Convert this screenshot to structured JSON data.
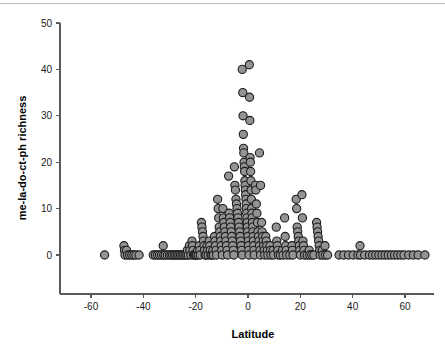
{
  "chart_data": {
    "type": "scatter",
    "title": "",
    "xlabel": "Latitude",
    "ylabel": "me-la-do-ct-ph richness",
    "xlim": [
      -70,
      75
    ],
    "ylim": [
      -4,
      50
    ],
    "xticks": [
      -60,
      -40,
      -20,
      0,
      20,
      40,
      60
    ],
    "xtick_labels": [
      "-60",
      "-40",
      "-20",
      "0",
      "20",
      "40",
      "60"
    ],
    "yticks": [
      0,
      10,
      20,
      30,
      40,
      50
    ],
    "ytick_labels": [
      "0",
      "10",
      "20",
      "30",
      "40",
      "50"
    ],
    "grid": false,
    "legend": null,
    "marker": {
      "shape": "circle",
      "fill_color": "#939393",
      "edge_color": "#1c1c1c",
      "radius_px": 4.1
    },
    "series": [
      {
        "name": "sites",
        "points": [
          [
            -54.8,
            0
          ],
          [
            -47.4,
            2
          ],
          [
            -47.2,
            1
          ],
          [
            -47.0,
            0
          ],
          [
            -46.4,
            1
          ],
          [
            -46.0,
            0
          ],
          [
            -45.2,
            0
          ],
          [
            -44.4,
            0
          ],
          [
            -43.6,
            0
          ],
          [
            -42.8,
            0
          ],
          [
            -41.6,
            0
          ],
          [
            -36.2,
            0
          ],
          [
            -35.4,
            0
          ],
          [
            -34.6,
            0
          ],
          [
            -33.8,
            0
          ],
          [
            -33.0,
            0
          ],
          [
            -32.4,
            2
          ],
          [
            -32.2,
            0
          ],
          [
            -31.6,
            0
          ],
          [
            -30.8,
            0
          ],
          [
            -30.0,
            0
          ],
          [
            -29.4,
            0
          ],
          [
            -28.8,
            0
          ],
          [
            -28.2,
            0
          ],
          [
            -27.6,
            0
          ],
          [
            -27.0,
            0
          ],
          [
            -26.4,
            0
          ],
          [
            -25.8,
            0
          ],
          [
            -25.2,
            0
          ],
          [
            -24.6,
            0
          ],
          [
            -24.0,
            0
          ],
          [
            -23.4,
            0
          ],
          [
            -23.2,
            1
          ],
          [
            -22.8,
            0
          ],
          [
            -22.4,
            2
          ],
          [
            -22.2,
            1
          ],
          [
            -21.8,
            0
          ],
          [
            -21.4,
            3
          ],
          [
            -21.2,
            2
          ],
          [
            -21.0,
            1
          ],
          [
            -20.8,
            0
          ],
          [
            -20.4,
            0
          ],
          [
            -20.0,
            0
          ],
          [
            -19.6,
            0
          ],
          [
            -19.2,
            1
          ],
          [
            -19.0,
            0
          ],
          [
            -18.6,
            2
          ],
          [
            -18.4,
            1
          ],
          [
            -18.2,
            0
          ],
          [
            -17.8,
            7
          ],
          [
            -17.6,
            6
          ],
          [
            -17.4,
            5
          ],
          [
            -17.2,
            4
          ],
          [
            -17.0,
            3
          ],
          [
            -16.8,
            2
          ],
          [
            -16.6,
            1
          ],
          [
            -16.4,
            0
          ],
          [
            -16.0,
            0
          ],
          [
            -15.6,
            2
          ],
          [
            -15.4,
            1
          ],
          [
            -15.2,
            0
          ],
          [
            -14.8,
            3
          ],
          [
            -14.6,
            2
          ],
          [
            -14.4,
            1
          ],
          [
            -14.2,
            0
          ],
          [
            -13.8,
            0
          ],
          [
            -13.4,
            1
          ],
          [
            -13.2,
            0
          ],
          [
            -12.8,
            4
          ],
          [
            -12.6,
            3
          ],
          [
            -12.4,
            2
          ],
          [
            -12.2,
            1
          ],
          [
            -12.0,
            0
          ],
          [
            -11.6,
            12
          ],
          [
            -11.4,
            10
          ],
          [
            -11.2,
            8
          ],
          [
            -11.0,
            6
          ],
          [
            -10.8,
            5
          ],
          [
            -10.6,
            4
          ],
          [
            -10.4,
            3
          ],
          [
            -10.2,
            2
          ],
          [
            -10.0,
            1
          ],
          [
            -9.8,
            0
          ],
          [
            -9.6,
            10
          ],
          [
            -9.4,
            8
          ],
          [
            -9.2,
            7
          ],
          [
            -9.0,
            6
          ],
          [
            -8.8,
            5
          ],
          [
            -8.6,
            4
          ],
          [
            -8.4,
            3
          ],
          [
            -8.2,
            2
          ],
          [
            -8.0,
            1
          ],
          [
            -7.8,
            0
          ],
          [
            -7.4,
            17
          ],
          [
            -7.2,
            9
          ],
          [
            -7.0,
            8
          ],
          [
            -6.8,
            7
          ],
          [
            -6.6,
            6
          ],
          [
            -6.4,
            5
          ],
          [
            -6.2,
            4
          ],
          [
            -6.0,
            3
          ],
          [
            -5.8,
            2
          ],
          [
            -5.6,
            1
          ],
          [
            -5.4,
            0
          ],
          [
            -5.2,
            19
          ],
          [
            -5.0,
            15
          ],
          [
            -4.8,
            14
          ],
          [
            -4.6,
            12
          ],
          [
            -4.4,
            11
          ],
          [
            -4.2,
            10
          ],
          [
            -4.0,
            9
          ],
          [
            -3.8,
            8
          ],
          [
            -3.6,
            7
          ],
          [
            -3.4,
            6
          ],
          [
            -3.2,
            5
          ],
          [
            -3.0,
            4
          ],
          [
            -2.8,
            3
          ],
          [
            -2.6,
            2
          ],
          [
            -2.4,
            1
          ],
          [
            -2.2,
            0
          ],
          [
            -2.2,
            40
          ],
          [
            -2.0,
            35
          ],
          [
            -1.9,
            30
          ],
          [
            -1.8,
            26
          ],
          [
            -1.7,
            23
          ],
          [
            -1.6,
            22
          ],
          [
            -1.5,
            20
          ],
          [
            -1.4,
            19
          ],
          [
            -1.3,
            18
          ],
          [
            -1.2,
            16
          ],
          [
            -1.1,
            15
          ],
          [
            -1.0,
            14
          ],
          [
            -0.9,
            13
          ],
          [
            -0.8,
            12
          ],
          [
            -0.7,
            11
          ],
          [
            -0.6,
            10
          ],
          [
            -0.5,
            9
          ],
          [
            -0.4,
            8
          ],
          [
            -0.3,
            7
          ],
          [
            -0.2,
            6
          ],
          [
            -0.1,
            5
          ],
          [
            0.0,
            4
          ],
          [
            0.1,
            3
          ],
          [
            0.2,
            2
          ],
          [
            0.3,
            1
          ],
          [
            0.4,
            0
          ],
          [
            0.5,
            41
          ],
          [
            0.6,
            34
          ],
          [
            0.7,
            29
          ],
          [
            0.8,
            21
          ],
          [
            0.9,
            20
          ],
          [
            1.0,
            18
          ],
          [
            1.1,
            16
          ],
          [
            1.2,
            14
          ],
          [
            1.3,
            12
          ],
          [
            1.4,
            10
          ],
          [
            1.5,
            9
          ],
          [
            1.6,
            8
          ],
          [
            1.7,
            7
          ],
          [
            1.8,
            6
          ],
          [
            1.9,
            5
          ],
          [
            2.0,
            4
          ],
          [
            2.1,
            3
          ],
          [
            2.2,
            2
          ],
          [
            2.3,
            1
          ],
          [
            2.4,
            0
          ],
          [
            2.8,
            15
          ],
          [
            3.0,
            14
          ],
          [
            3.2,
            11
          ],
          [
            3.4,
            9
          ],
          [
            3.6,
            7
          ],
          [
            3.8,
            5
          ],
          [
            4.0,
            4
          ],
          [
            4.2,
            3
          ],
          [
            4.4,
            2
          ],
          [
            4.6,
            1
          ],
          [
            4.8,
            0
          ],
          [
            4.4,
            22
          ],
          [
            4.8,
            15
          ],
          [
            5.2,
            7
          ],
          [
            5.4,
            5
          ],
          [
            5.6,
            4
          ],
          [
            5.8,
            3
          ],
          [
            6.0,
            2
          ],
          [
            6.2,
            1
          ],
          [
            6.4,
            0
          ],
          [
            6.8,
            4
          ],
          [
            7.0,
            3
          ],
          [
            7.2,
            2
          ],
          [
            7.4,
            1
          ],
          [
            7.6,
            0
          ],
          [
            8.4,
            2
          ],
          [
            8.6,
            1
          ],
          [
            8.8,
            0
          ],
          [
            9.6,
            1
          ],
          [
            9.8,
            0
          ],
          [
            10.8,
            6
          ],
          [
            11.0,
            3
          ],
          [
            11.2,
            2
          ],
          [
            11.4,
            1
          ],
          [
            11.6,
            0
          ],
          [
            12.4,
            0
          ],
          [
            13.2,
            1
          ],
          [
            13.4,
            0
          ],
          [
            14.0,
            8
          ],
          [
            14.2,
            4
          ],
          [
            14.4,
            2
          ],
          [
            14.6,
            1
          ],
          [
            14.8,
            0
          ],
          [
            16.0,
            0
          ],
          [
            16.8,
            2
          ],
          [
            17.0,
            1
          ],
          [
            17.2,
            0
          ],
          [
            18.4,
            12
          ],
          [
            18.6,
            10
          ],
          [
            18.8,
            6
          ],
          [
            19.0,
            5
          ],
          [
            19.2,
            4
          ],
          [
            19.4,
            3
          ],
          [
            19.6,
            2
          ],
          [
            19.8,
            1
          ],
          [
            20.0,
            0
          ],
          [
            20.6,
            13
          ],
          [
            20.8,
            8
          ],
          [
            21.0,
            3
          ],
          [
            21.2,
            2
          ],
          [
            21.4,
            1
          ],
          [
            21.6,
            0
          ],
          [
            22.6,
            0
          ],
          [
            23.4,
            1
          ],
          [
            23.6,
            0
          ],
          [
            24.4,
            0
          ],
          [
            25.2,
            0
          ],
          [
            26.2,
            7
          ],
          [
            26.4,
            6
          ],
          [
            26.6,
            5
          ],
          [
            26.8,
            4
          ],
          [
            27.0,
            3
          ],
          [
            27.2,
            2
          ],
          [
            27.4,
            1
          ],
          [
            27.6,
            0
          ],
          [
            28.4,
            1
          ],
          [
            28.6,
            0
          ],
          [
            29.4,
            2
          ],
          [
            29.6,
            0
          ],
          [
            30.4,
            0
          ],
          [
            34.8,
            0
          ],
          [
            36.6,
            0
          ],
          [
            38.4,
            0
          ],
          [
            40.2,
            0
          ],
          [
            42.0,
            0
          ],
          [
            42.8,
            2
          ],
          [
            43.0,
            0
          ],
          [
            44.6,
            0
          ],
          [
            46.4,
            0
          ],
          [
            47.6,
            0
          ],
          [
            48.8,
            0
          ],
          [
            50.0,
            0
          ],
          [
            51.2,
            0
          ],
          [
            52.4,
            0
          ],
          [
            53.6,
            0
          ],
          [
            54.8,
            0
          ],
          [
            56.0,
            0
          ],
          [
            57.2,
            0
          ],
          [
            58.4,
            0
          ],
          [
            59.6,
            0
          ],
          [
            61.4,
            0
          ],
          [
            63.2,
            0
          ],
          [
            65.0,
            0
          ],
          [
            67.6,
            0
          ]
        ]
      }
    ]
  },
  "axis": {
    "x_title": "Latitude",
    "y_title": "me-la-do-ct-ph richness"
  }
}
